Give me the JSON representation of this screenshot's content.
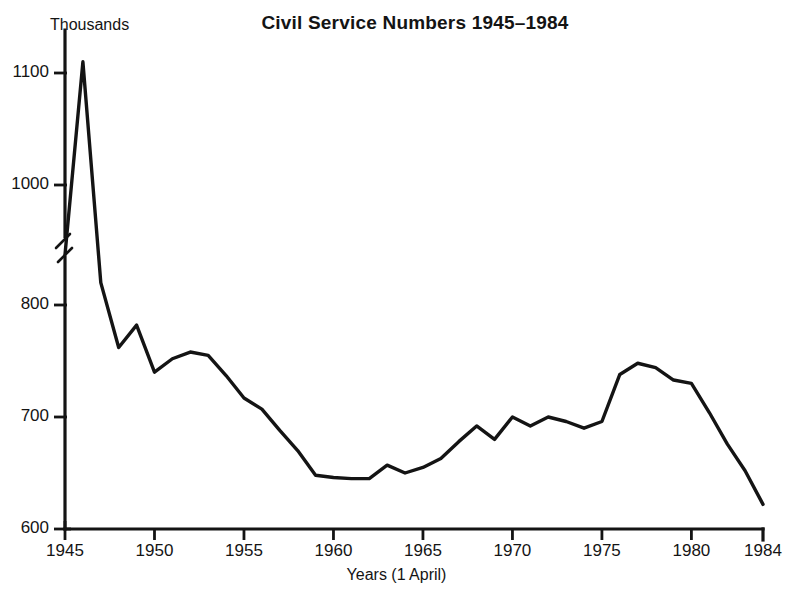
{
  "chart_data": {
    "type": "line",
    "title": "Civil Service Numbers 1945–1984",
    "xlabel": "Years (1 April)",
    "ylabel": "Thousands",
    "ylim": [
      600,
      1140
    ],
    "xlim": [
      1945,
      1984
    ],
    "grid": false,
    "legend": "none",
    "y_axis_break": true,
    "y_axis_break_between": [
      850,
      1000
    ],
    "ytick_labels": [
      "600",
      "700",
      "800",
      "1000",
      "1100"
    ],
    "ytick_values": [
      600,
      700,
      800,
      1000,
      1100
    ],
    "xtick_labels": [
      "1945",
      "1950",
      "1955",
      "1960",
      "1965",
      "1970",
      "1975",
      "1980",
      "1984"
    ],
    "xtick_values": [
      1945,
      1950,
      1955,
      1960,
      1965,
      1970,
      1975,
      1980,
      1984
    ],
    "series": [
      {
        "name": "Civil Service Numbers",
        "color": "#141414",
        "x": [
          1945,
          1946,
          1947,
          1948,
          1949,
          1950,
          1951,
          1952,
          1953,
          1954,
          1955,
          1956,
          1957,
          1958,
          1959,
          1960,
          1961,
          1962,
          1963,
          1964,
          1965,
          1966,
          1967,
          1968,
          1969,
          1970,
          1971,
          1972,
          1973,
          1974,
          1975,
          1976,
          1977,
          1978,
          1979,
          1980,
          1981,
          1982,
          1983,
          1984
        ],
        "values": [
          845,
          1110,
          820,
          762,
          782,
          740,
          752,
          758,
          755,
          737,
          717,
          707,
          688,
          670,
          648,
          646,
          645,
          645,
          657,
          650,
          655,
          663,
          678,
          692,
          680,
          700,
          692,
          700,
          696,
          690,
          696,
          738,
          748,
          744,
          733,
          730,
          704,
          676,
          652,
          622
        ]
      }
    ]
  },
  "axes": {
    "y_unit_label": "Thousands",
    "x_title": "Years (1 April)"
  }
}
